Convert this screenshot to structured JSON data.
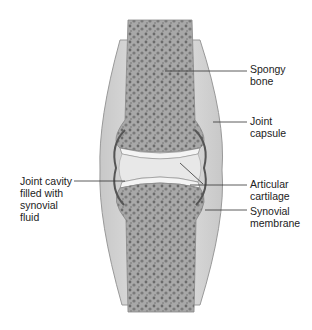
{
  "labels": {
    "spongy_bone": "Spongy\nbone",
    "joint_capsule": "Joint\ncapsule",
    "articular_cartilage": "Articular\ncartilage",
    "synovial_membrane": "Synovial\nmembrane",
    "joint_cavity": "Joint cavity\nfilled with\nsynovial\nfluid"
  },
  "colors": {
    "bone": "#a9a9a9",
    "bone_dark": "#6f6f6f",
    "capsule": "#d8d8d8",
    "cartilage": "#f4f4f4",
    "membrane": "#555555",
    "leader": "#333333"
  }
}
